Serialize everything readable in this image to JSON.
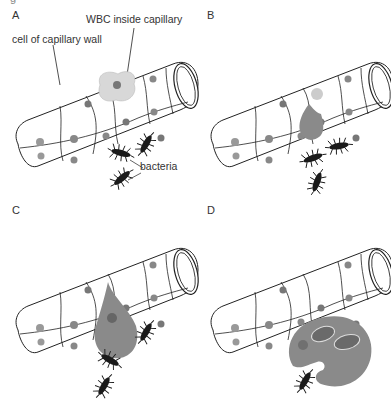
{
  "figure": {
    "top_fragment": "g",
    "panels": [
      {
        "id": "A",
        "label": "A",
        "annotations": {
          "wbc": "WBC inside capillary",
          "wall_cell": "cell of capillary wall",
          "bacteria": "bacteria"
        }
      },
      {
        "id": "B",
        "label": "B"
      },
      {
        "id": "C",
        "label": "C"
      },
      {
        "id": "D",
        "label": "D"
      }
    ]
  },
  "colors": {
    "outline": "#222222",
    "wbc_fill": "#8a8a8a",
    "wbc_stipple": "#bdbdbd",
    "nucleus": "#777777",
    "bacteria": "#1a1a1a",
    "background": "#ffffff"
  }
}
